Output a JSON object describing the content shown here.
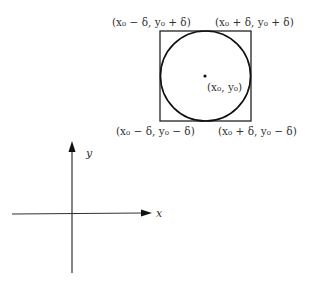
{
  "figure": {
    "corner_labels": {
      "top_left": "(x₀ − δ, y₀ + δ)",
      "top_right": "(x₀ + δ, y₀ + δ)",
      "bottom_left": "(x₀ − δ, y₀ − δ)",
      "bottom_right": "(x₀ + δ, y₀ − δ)"
    },
    "center_label": "(x₀, y₀)",
    "axes": {
      "x_label": "x",
      "y_label": "y"
    },
    "colors": {
      "line": "#222222",
      "text": "#333333"
    }
  }
}
